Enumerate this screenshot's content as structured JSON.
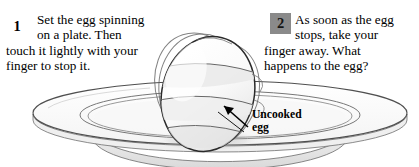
{
  "figure": {
    "background_color": "#ffffff",
    "ink_color": "#000000"
  },
  "steps": [
    {
      "number": "1",
      "marker_style": "plain",
      "marker_background": "transparent",
      "lines": [
        "Set the egg spinning",
        "on a plate. Then",
        "touch it lightly with your",
        "finger to stop it."
      ],
      "text": "Set the egg spinning on a plate. Then touch it lightly with your finger to stop it."
    },
    {
      "number": "2",
      "marker_style": "boxed",
      "marker_background": "#8a8a8a",
      "lines": [
        "As soon as the egg",
        "stops, take your",
        "finger away. What",
        "happens to the egg?"
      ],
      "text": "As soon as the egg stops, take your finger away. What happens to the egg?"
    }
  ],
  "callout": {
    "lines": [
      "Uncooked",
      "egg"
    ],
    "text": "Uncooked egg",
    "pointer": "arrow pointing up-left to the egg"
  },
  "illustration": {
    "subject": "raw egg spinning on a plate",
    "egg": {
      "name": "uncooked-egg",
      "description": "tilted ovoid drawn with overlapping motion outlines indicating spin",
      "fill": "#fbfbfb",
      "outline": "#2a2a2a",
      "shade": "#e6e6e6"
    },
    "plate": {
      "name": "plate",
      "description": "wide shallow white plate seen in perspective with concentric inner rim",
      "fill": "#ffffff",
      "outline": "#555555",
      "shade": "#ededed"
    }
  }
}
